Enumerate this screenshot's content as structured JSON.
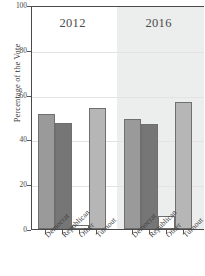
{
  "chart_data": {
    "type": "bar",
    "title": "",
    "xlabel": "",
    "ylabel": "Percentage of the Vote",
    "ylim": [
      0,
      100
    ],
    "yticks": [
      0,
      20,
      40,
      60,
      80,
      100
    ],
    "grid": true,
    "legend": "none",
    "panels": [
      {
        "label": "2012",
        "categories": [
          "Democrat",
          "Republican",
          "Other",
          "Turnout"
        ],
        "values": [
          51.3,
          47.3,
          2.0,
          54.0
        ]
      },
      {
        "label": "2016",
        "categories": [
          "Democrat",
          "Republican",
          "Other",
          "Turnout"
        ],
        "values": [
          49.0,
          46.8,
          6.0,
          56.5
        ]
      }
    ],
    "series_colors": {
      "Democrat": "#9a9a9a",
      "Republican": "#767676",
      "Other": "#fdfdfd",
      "Turnout": "#b6b6b6"
    },
    "panel_background_2016": "#eceded",
    "bar_border_color": "#6f6f6f",
    "axis_color": "#4a4a4a"
  },
  "axis": {
    "y_title": "Percentage of the Vote",
    "y_ticks": [
      "100",
      "80",
      "60",
      "40",
      "20",
      "0"
    ]
  },
  "panel_captions": {
    "left": "2012",
    "right": "2016"
  },
  "x_labels": {
    "democrat": "Democrat",
    "republican": "Republican",
    "other": "Other",
    "turnout": "Turnout"
  }
}
